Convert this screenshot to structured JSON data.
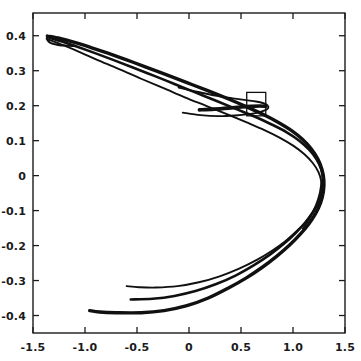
{
  "figure": {
    "title": "",
    "background_color": "#ffffff",
    "line_color": "#101010",
    "axis_color": "#1b1b1b",
    "width_px": 361,
    "height_px": 361
  },
  "chart_data": {
    "type": "line",
    "title": "",
    "xlabel": "",
    "ylabel": "",
    "xlim": [
      -1.5,
      1.5
    ],
    "ylim": [
      -0.45,
      0.465
    ],
    "grid": false,
    "legend": null,
    "legend_position": "none",
    "x_ticks": [
      -1.5,
      -1.0,
      -0.5,
      0,
      0.5,
      1.0,
      1.5
    ],
    "x_tick_labels": [
      "-1.5",
      "-1.0",
      "-0.5",
      "0",
      "0.5",
      "1.0",
      "1.5"
    ],
    "y_ticks": [
      0.4,
      0.3,
      0.2,
      0.1,
      0,
      -0.1,
      -0.2,
      -0.3,
      -0.4
    ],
    "y_tick_labels": [
      "0.4",
      "0.3",
      "0.2",
      "0.1",
      "0",
      "-0.1",
      "-0.2",
      "-0.3",
      "-0.4"
    ],
    "annotations": [
      {
        "name": "zoom-region-rectangle",
        "shape": "rectangle",
        "x0": 0.555,
        "y0": 0.171,
        "x1": 0.738,
        "y1": 0.238
      }
    ],
    "series": [
      {
        "name": "outer-upper-branch",
        "stroke_width": 3.4,
        "points": [
          [
            -1.362,
            0.399
          ],
          [
            -1.24,
            0.392
          ],
          [
            -1.1,
            0.381
          ],
          [
            -0.95,
            0.367
          ],
          [
            -0.78,
            0.35
          ],
          [
            -0.6,
            0.331
          ],
          [
            -0.42,
            0.311
          ],
          [
            -0.22,
            0.289
          ],
          [
            -0.02,
            0.266
          ],
          [
            0.18,
            0.243
          ],
          [
            0.38,
            0.219
          ],
          [
            0.56,
            0.196
          ],
          [
            0.72,
            0.174
          ],
          [
            0.86,
            0.152
          ],
          [
            0.99,
            0.128
          ],
          [
            1.09,
            0.104
          ],
          [
            1.175,
            0.077
          ],
          [
            1.238,
            0.048
          ],
          [
            1.278,
            0.018
          ],
          [
            1.297,
            -0.014
          ],
          [
            1.292,
            -0.046
          ],
          [
            1.265,
            -0.078
          ],
          [
            1.218,
            -0.108
          ],
          [
            1.152,
            -0.138
          ],
          [
            1.068,
            -0.168
          ],
          [
            0.965,
            -0.199
          ],
          [
            0.845,
            -0.23
          ],
          [
            0.705,
            -0.262
          ],
          [
            0.548,
            -0.293
          ],
          [
            0.375,
            -0.322
          ],
          [
            0.185,
            -0.35
          ],
          [
            -0.02,
            -0.372
          ],
          [
            -0.24,
            -0.386
          ],
          [
            -0.46,
            -0.392
          ],
          [
            -0.7,
            -0.392
          ],
          [
            -0.86,
            -0.39
          ],
          [
            -0.955,
            -0.386
          ]
        ]
      },
      {
        "name": "second-upper-branch",
        "stroke_width": 2.6,
        "points": [
          [
            -1.36,
            0.396
          ],
          [
            -1.23,
            0.384
          ],
          [
            -1.08,
            0.369
          ],
          [
            -0.91,
            0.351
          ],
          [
            -0.73,
            0.331
          ],
          [
            -0.54,
            0.309
          ],
          [
            -0.34,
            0.286
          ],
          [
            -0.14,
            0.262
          ],
          [
            0.06,
            0.238
          ],
          [
            0.26,
            0.214
          ],
          [
            0.45,
            0.191
          ],
          [
            0.63,
            0.169
          ],
          [
            0.79,
            0.147
          ],
          [
            0.94,
            0.124
          ],
          [
            1.06,
            0.1
          ],
          [
            1.155,
            0.074
          ],
          [
            1.228,
            0.046
          ],
          [
            1.272,
            0.017
          ],
          [
            1.288,
            -0.013
          ],
          [
            1.278,
            -0.043
          ],
          [
            1.245,
            -0.074
          ],
          [
            1.192,
            -0.104
          ],
          [
            1.118,
            -0.134
          ],
          [
            1.025,
            -0.164
          ],
          [
            0.912,
            -0.195
          ],
          [
            0.778,
            -0.226
          ],
          [
            0.625,
            -0.256
          ],
          [
            0.452,
            -0.285
          ],
          [
            0.262,
            -0.31
          ],
          [
            0.062,
            -0.33
          ],
          [
            -0.14,
            -0.344
          ],
          [
            -0.35,
            -0.352
          ],
          [
            -0.56,
            -0.354
          ]
        ]
      },
      {
        "name": "inner-upper-branch",
        "stroke_width": 1.9,
        "points": [
          [
            -1.358,
            0.39
          ],
          [
            -1.21,
            0.373
          ],
          [
            -1.04,
            0.352
          ],
          [
            -0.86,
            0.328
          ],
          [
            -0.66,
            0.303
          ],
          [
            -0.46,
            0.277
          ],
          [
            -0.25,
            0.251
          ],
          [
            -0.04,
            0.224
          ],
          [
            0.17,
            0.199
          ],
          [
            0.37,
            0.175
          ],
          [
            0.555,
            0.152
          ],
          [
            0.725,
            0.13
          ],
          [
            0.875,
            0.108
          ],
          [
            1.005,
            0.085
          ],
          [
            1.11,
            0.061
          ],
          [
            1.19,
            0.036
          ],
          [
            1.245,
            0.01
          ],
          [
            1.272,
            -0.017
          ],
          [
            1.272,
            -0.045
          ],
          [
            1.248,
            -0.073
          ],
          [
            1.2,
            -0.101
          ],
          [
            1.132,
            -0.129
          ],
          [
            1.042,
            -0.157
          ],
          [
            0.932,
            -0.186
          ],
          [
            0.802,
            -0.214
          ],
          [
            0.652,
            -0.241
          ],
          [
            0.482,
            -0.266
          ],
          [
            0.295,
            -0.288
          ],
          [
            0.095,
            -0.305
          ],
          [
            -0.11,
            -0.316
          ],
          [
            -0.32,
            -0.32
          ],
          [
            -0.48,
            -0.319
          ],
          [
            -0.6,
            -0.316
          ]
        ]
      },
      {
        "name": "loop-inner-upper",
        "stroke_width": 1.9,
        "points": [
          [
            -0.1,
            0.252
          ],
          [
            0.09,
            0.239
          ],
          [
            0.27,
            0.228
          ],
          [
            0.42,
            0.221
          ],
          [
            0.545,
            0.216
          ],
          [
            0.645,
            0.212
          ],
          [
            0.715,
            0.207
          ],
          [
            0.755,
            0.201
          ],
          [
            0.762,
            0.194
          ],
          [
            0.735,
            0.187
          ],
          [
            0.672,
            0.181
          ],
          [
            0.575,
            0.176
          ],
          [
            0.445,
            0.172
          ],
          [
            0.285,
            0.17
          ],
          [
            0.11,
            0.173
          ],
          [
            -0.06,
            0.18
          ]
        ]
      },
      {
        "name": "loop-cusp-band",
        "stroke_width": 3.6,
        "points": [
          [
            0.1,
            0.188
          ],
          [
            0.24,
            0.19
          ],
          [
            0.38,
            0.193
          ],
          [
            0.5,
            0.196
          ],
          [
            0.6,
            0.198
          ],
          [
            0.68,
            0.199
          ],
          [
            0.735,
            0.198
          ]
        ]
      },
      {
        "name": "left-cusp-fold",
        "stroke_width": 2.2,
        "points": [
          [
            -1.368,
            0.392
          ],
          [
            -1.356,
            0.386
          ],
          [
            -1.34,
            0.381
          ],
          [
            -1.31,
            0.377
          ],
          [
            -1.26,
            0.374
          ],
          [
            -1.19,
            0.372
          ],
          [
            -1.1,
            0.371
          ]
        ]
      },
      {
        "name": "lower-right-tail",
        "stroke_width": 2.0,
        "points": [
          [
            1.276,
            -0.016
          ],
          [
            1.258,
            -0.05
          ],
          [
            1.222,
            -0.084
          ],
          [
            1.168,
            -0.118
          ],
          [
            1.094,
            -0.152
          ]
        ]
      }
    ]
  },
  "axes": {
    "x_axis_name": "x-axis",
    "y_axis_name": "y-axis",
    "frame": "box"
  }
}
